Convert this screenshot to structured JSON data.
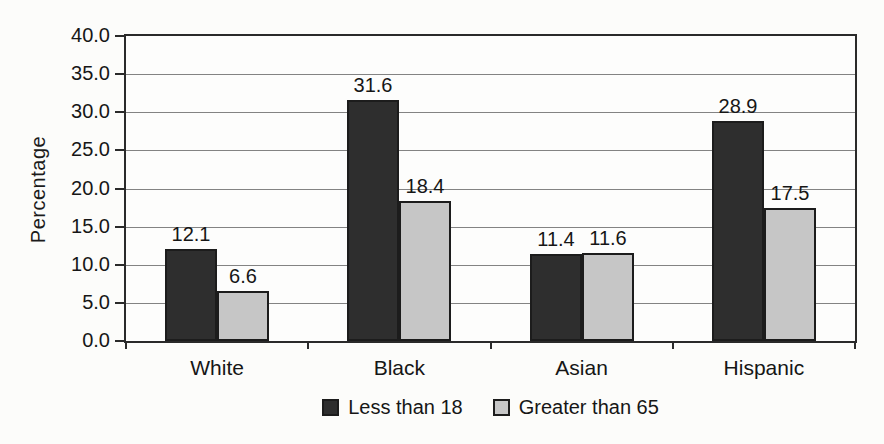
{
  "chart_data": {
    "type": "bar",
    "title": "",
    "xlabel": "",
    "ylabel": "Percentage",
    "categories": [
      "White",
      "Black",
      "Asian",
      "Hispanic"
    ],
    "series": [
      {
        "name": "Less than 18",
        "color": "#2e2e2e",
        "values": [
          12.1,
          31.6,
          11.4,
          28.9
        ]
      },
      {
        "name": "Greater than 65",
        "color": "#c6c6c6",
        "values": [
          6.6,
          18.4,
          11.6,
          17.5
        ]
      }
    ],
    "value_labels": [
      "12.1",
      "6.6",
      "31.6",
      "18.4",
      "11.4",
      "11.6",
      "28.9",
      "17.5"
    ],
    "ylim": [
      0,
      40
    ],
    "ytick_step": 5,
    "ytick_labels": [
      "0.0",
      "5.0",
      "10.0",
      "15.0",
      "20.0",
      "25.0",
      "30.0",
      "35.0",
      "40.0"
    ],
    "grid": "horizontal",
    "legend_position": "bottom"
  },
  "colors": {
    "background": "#fcfcfa",
    "plot_border": "#2a2a2a",
    "gridline": "#838383",
    "bar_dark": "#2e2e2e",
    "bar_light": "#c6c6c6",
    "bar_border": "#1c1c1c",
    "text": "#161616"
  }
}
